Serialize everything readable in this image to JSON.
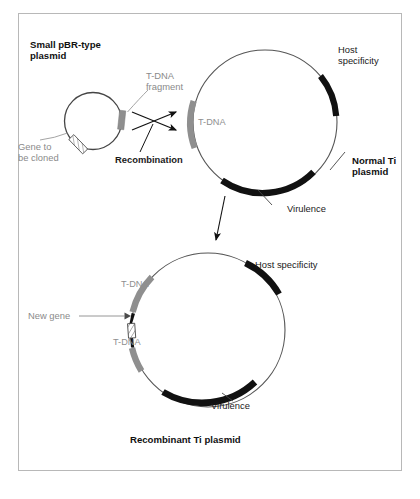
{
  "figure": {
    "title_small_plasmid": "Small pBR-type\nplasmid",
    "frame_color": "#b8b8b8",
    "background": "#ffffff"
  },
  "colors": {
    "black_segment": "#111111",
    "gray_segment": "#8f8f8f",
    "gray_text": "#8a8a8a",
    "black_text": "#1a1a1a",
    "circle_outline": "#555555",
    "frame": "#b8b8b8"
  },
  "small_plasmid": {
    "title_line1": "Small pBR-type",
    "title_line2": "plasmid",
    "tdna_fragment_line1": "T-DNA",
    "tdna_fragment_line2": "fragment",
    "gene_label_line1": "Gene to",
    "gene_label_line2": "be cloned",
    "segments": [
      {
        "name": "t-dna-fragment",
        "color": "#8f8f8f",
        "label": "T-DNA fragment"
      },
      {
        "name": "gene-to-be-cloned",
        "color": "hatched",
        "label": "Gene to be cloned"
      }
    ]
  },
  "recombination": {
    "label": "Recombination"
  },
  "normal_ti_plasmid": {
    "title_line1": "Normal Ti",
    "title_line2": "plasmid",
    "host_specificity_line1": "Host",
    "host_specificity_line2": "specificity",
    "tdna_label": "T-DNA",
    "virulence_label": "Virulence",
    "segments": [
      {
        "name": "host-specificity",
        "color": "#111111",
        "label": "Host specificity"
      },
      {
        "name": "t-dna",
        "color": "#8f8f8f",
        "label": "T-DNA"
      },
      {
        "name": "virulence",
        "color": "#111111",
        "label": "Virulence"
      }
    ]
  },
  "recombinant_ti_plasmid": {
    "caption": "Recombinant Ti plasmid",
    "host_specificity_label": "Host specificity",
    "tdna_label_upper": "T-DNA",
    "tdna_label_lower": "T-DNA",
    "new_gene_label": "New gene",
    "virulence_label": "Virulence",
    "segments": [
      {
        "name": "host-specificity",
        "color": "#111111",
        "label": "Host specificity"
      },
      {
        "name": "t-dna-upper",
        "color": "#8f8f8f",
        "label": "T-DNA"
      },
      {
        "name": "new-gene",
        "color": "hatched",
        "label": "New gene"
      },
      {
        "name": "t-dna-lower",
        "color": "#8f8f8f",
        "label": "T-DNA"
      },
      {
        "name": "virulence",
        "color": "#111111",
        "label": "Virulence"
      }
    ]
  }
}
